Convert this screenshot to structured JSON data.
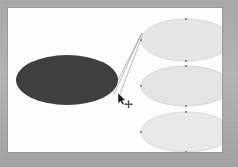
{
  "app": {
    "title": "Diagram Canvas",
    "canvas_label": "drawing-canvas",
    "background_color": "#fdfdfd",
    "frame_color": "#b0b0b0"
  },
  "canvas": {
    "width": 214,
    "height": 144,
    "origin_x": 8,
    "origin_y": 8
  },
  "shapes": [
    {
      "id": "ellipse-filled-dark",
      "name": "dark-ellipse",
      "type": "ellipse",
      "cx": 59,
      "cy": 72,
      "rx": 51,
      "ry": 25,
      "fill": "#3f3f3f",
      "stroke": "none",
      "selected": false,
      "label": ""
    },
    {
      "id": "ellipse-top",
      "name": "light-ellipse-top",
      "type": "ellipse",
      "cx": 178,
      "cy": 32,
      "rx": 45,
      "ry": 21,
      "fill": "#e6e6e6",
      "stroke": "#d2d2d2",
      "selected": true,
      "label": ""
    },
    {
      "id": "ellipse-middle",
      "name": "light-ellipse-middle",
      "type": "ellipse",
      "cx": 178,
      "cy": 78,
      "rx": 45,
      "ry": 20,
      "fill": "#e4e4e4",
      "stroke": "#d2d2d2",
      "selected": true,
      "label": ""
    },
    {
      "id": "ellipse-bottom",
      "name": "light-ellipse-bottom",
      "type": "ellipse",
      "cx": 178,
      "cy": 124,
      "rx": 45,
      "ry": 20,
      "fill": "#e9e9e9",
      "stroke": "#d6d6d6",
      "selected": true,
      "label": ""
    }
  ],
  "connectors": [
    {
      "id": "connector-1",
      "name": "connector-dark-to-top",
      "from": "ellipse-filled-dark",
      "to": "ellipse-top",
      "x1": 110,
      "y1": 72,
      "x2": 134,
      "y2": 25,
      "stroke": "#9a9a9a",
      "stroke_width": 0.7
    },
    {
      "id": "connector-2",
      "name": "connector-cursor-to-top-a",
      "from": "cursor",
      "to": "ellipse-top",
      "x1": 106,
      "y1": 86,
      "x2": 134,
      "y2": 25,
      "stroke": "#9a9a9a",
      "stroke_width": 0.7
    },
    {
      "id": "connector-3",
      "name": "connector-cursor-to-top-b",
      "from": "cursor",
      "to": "ellipse-top",
      "x1": 112,
      "y1": 86,
      "x2": 135,
      "y2": 26,
      "stroke": "#9a9a9a",
      "stroke_width": 0.7
    }
  ],
  "selection_handles": {
    "color": "#8d8d8d",
    "size": 2,
    "positions": [
      "top",
      "bottom",
      "left",
      "right"
    ]
  },
  "cursor": {
    "name": "move-cursor",
    "x": 108,
    "y": 84,
    "type": "arrow-with-move-crosshair",
    "arrow_color": "#1a1a1a",
    "crosshair_color": "#555555"
  }
}
